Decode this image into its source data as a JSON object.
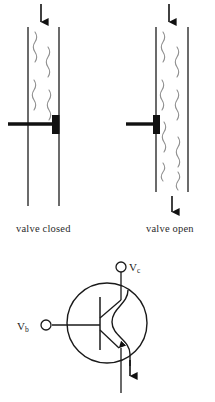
{
  "figure": {
    "panels": [
      {
        "id": "valve-closed",
        "caption": "valve closed",
        "state": "closed",
        "inlet_arrow": "down",
        "outlet_arrow": "none",
        "gate_position": "inserted",
        "flow_region": "above-gate-only"
      },
      {
        "id": "valve-open",
        "caption": "valve open",
        "state": "open",
        "inlet_arrow": "down",
        "outlet_arrow": "down",
        "gate_position": "retracted",
        "flow_region": "full-pipe"
      }
    ],
    "circuit": {
      "id": "npn-transistor",
      "device_type": "npn-bipolar-transistor",
      "collector_label": "V",
      "collector_subscript": "c",
      "base_label": "V",
      "base_subscript": "b",
      "emitter_arrow": "down",
      "current_path": "wavy"
    },
    "colors": {
      "ink": "#1a1a1a",
      "pipe_wall": "#3a3a3a",
      "flow_squiggle": "#8a8a8a",
      "gate_block": "#111111",
      "background": "#ffffff"
    }
  }
}
